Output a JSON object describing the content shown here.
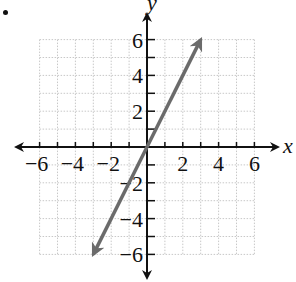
{
  "bullet": "•",
  "chart_data": {
    "type": "line",
    "title": "",
    "xlabel": "x",
    "ylabel": "y",
    "xlim": [
      -6,
      6
    ],
    "ylim": [
      -6,
      6
    ],
    "grid": true,
    "x_ticks": [
      -6,
      -5,
      -4,
      -3,
      -2,
      -1,
      1,
      2,
      3,
      4,
      5,
      6
    ],
    "y_ticks": [
      -6,
      -5,
      -4,
      -3,
      -2,
      -1,
      1,
      2,
      3,
      4,
      5,
      6
    ],
    "x_tick_labels": [
      "-6",
      "-4",
      "-2",
      "2",
      "4",
      "6"
    ],
    "y_tick_labels": [
      "6",
      "4",
      "2",
      "-2",
      "-4",
      "-6"
    ],
    "series": [
      {
        "name": "y = 2x",
        "x": [
          -3,
          3
        ],
        "y": [
          -6,
          6
        ],
        "color": "#6b6b6b",
        "arrows": "both"
      }
    ]
  },
  "colors": {
    "axis": "#111111",
    "grid": "#c8c8c8",
    "line": "#6b6b6b"
  }
}
